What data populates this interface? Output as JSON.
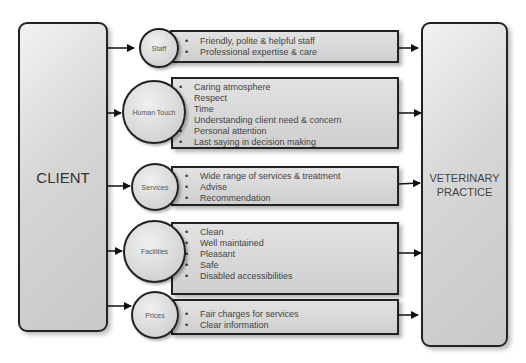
{
  "diagram": {
    "left_box": {
      "label": "CLIENT"
    },
    "right_box": {
      "label": "VETERINARY\nPRACTICE"
    },
    "factors": [
      {
        "name": "Staff",
        "items": [
          "Friendly, polite & helpful staff",
          "Professional expertise & care"
        ]
      },
      {
        "name": "Human Touch",
        "items": [
          "Caring atmosphere",
          "Respect",
          "Time",
          "Understanding client need & concern",
          "Personal attention",
          "Last saying in decision making"
        ]
      },
      {
        "name": "Services",
        "items": [
          "Wide range of services & treatment",
          "Advise",
          "Recommendation"
        ]
      },
      {
        "name": "Facilities",
        "items": [
          "Clean",
          "Well maintained",
          "Pleasant",
          "Safe",
          "Disabled accessibilities"
        ]
      },
      {
        "name": "Prices",
        "items": [
          "Fair charges for services",
          "Clear information"
        ]
      }
    ],
    "colors": {
      "stroke": "#222222",
      "fill_light": "#f0f0f0",
      "fill_dark": "#c8c8c8",
      "text": "#444444"
    }
  }
}
